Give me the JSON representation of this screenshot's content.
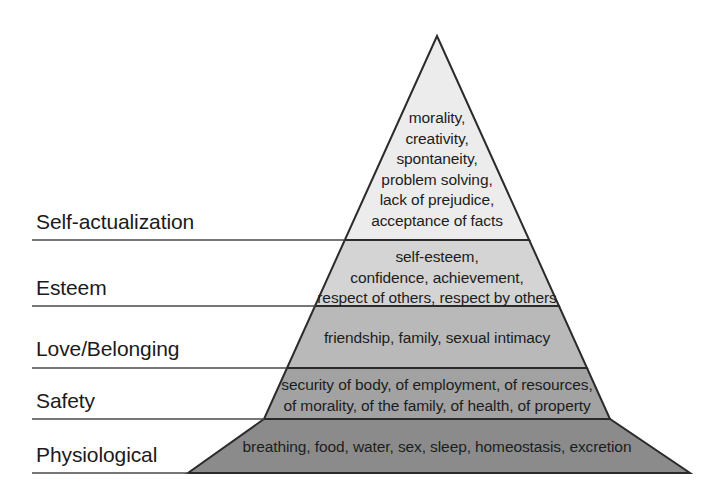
{
  "diagram": {
    "type": "pyramid",
    "apex": {
      "x": 437,
      "y": 36
    },
    "base_left": {
      "x": 188,
      "y": 473
    },
    "base_right": {
      "x": 690,
      "y": 473
    },
    "outline_color": "#2b2b2b",
    "label_rule_color": "#4a4a4a",
    "background": "#ffffff",
    "tiers": [
      {
        "id": "self-actualization",
        "label": "Self-actualization",
        "fill": "#ececec",
        "top_y": 36,
        "bottom_y": 240,
        "lines": [
          "morality,",
          "creativity,",
          "spontaneity,",
          "problem solving,",
          "lack of prejudice,",
          "acceptance of facts"
        ]
      },
      {
        "id": "esteem",
        "label": "Esteem",
        "fill": "#d4d4d4",
        "top_y": 240,
        "bottom_y": 306,
        "lines": [
          "self-esteem,",
          "confidence, achievement,",
          "respect of others, respect by others"
        ]
      },
      {
        "id": "love-belonging",
        "label": "Love/Belonging",
        "fill": "#b9b9b9",
        "top_y": 306,
        "bottom_y": 368,
        "lines": [
          "friendship, family, sexual intimacy"
        ]
      },
      {
        "id": "safety",
        "label": "Safety",
        "fill": "#a2a2a2",
        "top_y": 368,
        "bottom_y": 419,
        "lines": [
          "security of body, of employment, of resources,",
          "of morality, of the family, of health, of property"
        ]
      },
      {
        "id": "physiological",
        "label": "Physiological",
        "fill": "#8b8b8b",
        "top_y": 419,
        "bottom_y": 473,
        "lines": [
          "breathing, food, water, sex, sleep, homeostasis, excretion"
        ]
      }
    ]
  }
}
